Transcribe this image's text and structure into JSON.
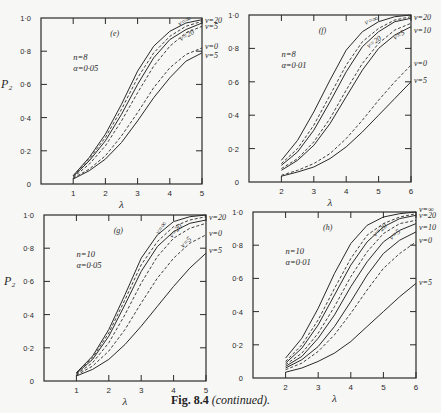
{
  "page": {
    "header_fragment": "344",
    "caption_fig": "Fig. 8.4",
    "caption_rest": "(continued)."
  },
  "chart_data": [
    {
      "type": "line",
      "panel": "(e)",
      "title": "(e)",
      "annotation": [
        "n=8",
        "α=0·05"
      ],
      "xlabel": "λ",
      "ylabel": "P₂",
      "xlim": [
        0,
        5
      ],
      "ylim": [
        0,
        1
      ],
      "xticks": [
        "1",
        "2",
        "3",
        "4",
        "5"
      ],
      "yticks": [
        "0",
        "0·2",
        "0·4",
        "0·6",
        "0·8",
        "1·0"
      ],
      "box": {
        "x0": 41,
        "x1": 202,
        "y0": 18,
        "y1": 184
      },
      "x": [
        1,
        1.5,
        2,
        2.5,
        3,
        3.5,
        4,
        4.5,
        5
      ],
      "series": [
        {
          "name": "ν=∞",
          "style": "solid",
          "values": [
            0.05,
            0.16,
            0.3,
            0.48,
            0.68,
            0.83,
            0.92,
            0.97,
            0.99
          ]
        },
        {
          "name": "ν=20",
          "style": "dashed",
          "values": [
            0.05,
            0.15,
            0.28,
            0.45,
            0.64,
            0.79,
            0.89,
            0.95,
            0.98
          ]
        },
        {
          "name": "ν=20 (solid)",
          "style": "solid",
          "values": [
            0.045,
            0.14,
            0.26,
            0.42,
            0.6,
            0.76,
            0.87,
            0.93,
            0.97
          ]
        },
        {
          "name": "ν=5",
          "style": "dashed",
          "values": [
            0.04,
            0.12,
            0.23,
            0.38,
            0.55,
            0.71,
            0.83,
            0.91,
            0.95
          ]
        },
        {
          "name": "ν=0",
          "style": "dashed",
          "values": [
            0.035,
            0.09,
            0.17,
            0.29,
            0.43,
            0.58,
            0.7,
            0.78,
            0.82
          ]
        },
        {
          "name": "ν=5 (lower)",
          "style": "solid",
          "values": [
            0.03,
            0.08,
            0.15,
            0.25,
            0.38,
            0.52,
            0.64,
            0.74,
            0.79
          ]
        }
      ],
      "right_labels": [
        {
          "text": "ν=20",
          "p": 0.99
        },
        {
          "text": "ν=5",
          "p": 0.95
        },
        {
          "text": "ν=0",
          "p": 0.83
        },
        {
          "text": "ν=5",
          "p": 0.78
        }
      ],
      "inline_labels": [
        {
          "text": "ν=∞",
          "lam": 4.3,
          "p": 0.95,
          "rot": -28
        },
        {
          "text": "ν=20",
          "lam": 4.35,
          "p": 0.86,
          "rot": -30
        }
      ]
    },
    {
      "type": "line",
      "panel": "(f)",
      "title": "(f)",
      "annotation": [
        "n=8",
        "α=0·01"
      ],
      "xlabel": "λ",
      "ylabel": "",
      "xlim": [
        1,
        6
      ],
      "ylim": [
        0,
        1
      ],
      "xticks": [
        "2",
        "3",
        "4",
        "5",
        "6"
      ],
      "yticks": [
        "0",
        "0·2",
        "0·4",
        "0·6",
        "0·8",
        "1·0"
      ],
      "box": {
        "x0": 249,
        "x1": 411,
        "y0": 15,
        "y1": 182
      },
      "x": [
        2,
        2.5,
        3,
        3.5,
        4,
        4.5,
        5,
        5.5,
        6
      ],
      "series": [
        {
          "name": "ν=∞",
          "style": "solid",
          "values": [
            0.13,
            0.25,
            0.42,
            0.61,
            0.79,
            0.9,
            0.96,
            0.99,
            1.0
          ]
        },
        {
          "name": "ν=20",
          "style": "dashed",
          "values": [
            0.11,
            0.2,
            0.34,
            0.52,
            0.7,
            0.84,
            0.92,
            0.97,
            0.99
          ]
        },
        {
          "name": "ν=20 (solid)",
          "style": "solid",
          "values": [
            0.1,
            0.18,
            0.31,
            0.48,
            0.66,
            0.81,
            0.9,
            0.96,
            0.98
          ]
        },
        {
          "name": "ν=5",
          "style": "dashed",
          "values": [
            0.08,
            0.14,
            0.24,
            0.38,
            0.55,
            0.71,
            0.83,
            0.91,
            0.95
          ]
        },
        {
          "name": "ν=10",
          "style": "solid",
          "values": [
            0.07,
            0.13,
            0.22,
            0.35,
            0.51,
            0.67,
            0.8,
            0.88,
            0.93
          ]
        },
        {
          "name": "ν=0",
          "style": "dashed",
          "values": [
            0.04,
            0.07,
            0.11,
            0.17,
            0.26,
            0.37,
            0.49,
            0.6,
            0.7
          ]
        },
        {
          "name": "ν=5 (lower)",
          "style": "solid",
          "values": [
            0.035,
            0.06,
            0.09,
            0.14,
            0.21,
            0.3,
            0.4,
            0.5,
            0.6
          ]
        }
      ],
      "right_labels": [
        {
          "text": "ν=20",
          "p": 0.99
        },
        {
          "text": "ν=10",
          "p": 0.91
        },
        {
          "text": "ν=0",
          "p": 0.71
        },
        {
          "text": "ν=5",
          "p": 0.61
        }
      ],
      "inline_labels": [
        {
          "text": "ν=∞",
          "lam": 4.6,
          "p": 0.94,
          "rot": -22
        },
        {
          "text": "ν=20",
          "lam": 4.7,
          "p": 0.8,
          "rot": -35
        },
        {
          "text": "ν=5",
          "lam": 5.5,
          "p": 0.85,
          "rot": -30
        }
      ]
    },
    {
      "type": "line",
      "panel": "(g)",
      "title": "(g)",
      "annotation": [
        "n=10",
        "α=0·05"
      ],
      "xlabel": "λ",
      "ylabel": "P₂",
      "xlim": [
        0,
        5
      ],
      "ylim": [
        0,
        1
      ],
      "xticks": [
        "1",
        "2",
        "3",
        "4",
        "5"
      ],
      "yticks": [
        "0",
        "0·2",
        "0·4",
        "0·6",
        "0·8",
        "1·0"
      ],
      "box": {
        "x0": 44,
        "x1": 206,
        "y0": 215,
        "y1": 381
      },
      "x": [
        1,
        1.5,
        2,
        2.5,
        3,
        3.5,
        4,
        4.5,
        5
      ],
      "series": [
        {
          "name": "ν=∞",
          "style": "solid",
          "values": [
            0.05,
            0.15,
            0.31,
            0.52,
            0.74,
            0.88,
            0.96,
            0.99,
            1.0
          ]
        },
        {
          "name": "ν=20",
          "style": "dashed",
          "values": [
            0.05,
            0.14,
            0.29,
            0.49,
            0.7,
            0.84,
            0.93,
            0.97,
            0.99
          ]
        },
        {
          "name": "ν=20 (solid)",
          "style": "solid",
          "values": [
            0.045,
            0.13,
            0.27,
            0.46,
            0.66,
            0.81,
            0.9,
            0.95,
            0.97
          ]
        },
        {
          "name": "ν=5",
          "style": "dashed",
          "values": [
            0.04,
            0.11,
            0.23,
            0.4,
            0.59,
            0.75,
            0.86,
            0.92,
            0.95
          ]
        },
        {
          "name": "ν=0",
          "style": "dashed",
          "values": [
            0.035,
            0.09,
            0.18,
            0.31,
            0.47,
            0.62,
            0.74,
            0.83,
            0.88
          ]
        },
        {
          "name": "ν=5 (lower)",
          "style": "solid",
          "values": [
            0.03,
            0.07,
            0.13,
            0.22,
            0.33,
            0.45,
            0.57,
            0.68,
            0.77
          ]
        }
      ],
      "right_labels": [
        {
          "text": "ν=20",
          "p": 0.99
        },
        {
          "text": "ν=0",
          "p": 0.89
        },
        {
          "text": "ν=5",
          "p": 0.79
        }
      ],
      "inline_labels": [
        {
          "text": "ν=∞",
          "lam": 3.55,
          "p": 0.88,
          "rot": -55
        },
        {
          "text": "ν=20",
          "lam": 3.95,
          "p": 0.86,
          "rot": -48
        },
        {
          "text": "ν=5",
          "lam": 4.3,
          "p": 0.8,
          "rot": -45
        }
      ]
    },
    {
      "type": "line",
      "panel": "(h)",
      "title": "(h)",
      "annotation": [
        "n=10",
        "α=0·01"
      ],
      "xlabel": "λ",
      "ylabel": "",
      "xlim": [
        1,
        6
      ],
      "ylim": [
        0,
        1
      ],
      "xticks": [
        "2",
        "3",
        "4",
        "5",
        "6"
      ],
      "yticks": [
        "0",
        "0·2",
        "0·4",
        "0·6",
        "0·8",
        "1·0"
      ],
      "box": {
        "x0": 253,
        "x1": 416,
        "y0": 212,
        "y1": 378
      },
      "x": [
        2,
        2.5,
        3,
        3.5,
        4,
        4.5,
        5,
        5.5,
        6
      ],
      "series": [
        {
          "name": "ν=∞",
          "style": "solid",
          "values": [
            0.12,
            0.24,
            0.42,
            0.63,
            0.81,
            0.92,
            0.97,
            0.99,
            1.0
          ]
        },
        {
          "name": "ν=20",
          "style": "dashed",
          "values": [
            0.1,
            0.2,
            0.35,
            0.54,
            0.72,
            0.86,
            0.93,
            0.97,
            0.99
          ]
        },
        {
          "name": "ν=20 (solid)",
          "style": "solid",
          "values": [
            0.09,
            0.18,
            0.32,
            0.5,
            0.68,
            0.82,
            0.91,
            0.96,
            0.98
          ]
        },
        {
          "name": "ν=5",
          "style": "dashed",
          "values": [
            0.08,
            0.15,
            0.27,
            0.43,
            0.61,
            0.76,
            0.87,
            0.93,
            0.95
          ]
        },
        {
          "name": "ν=10",
          "style": "solid",
          "values": [
            0.07,
            0.13,
            0.24,
            0.38,
            0.55,
            0.7,
            0.82,
            0.89,
            0.93
          ]
        },
        {
          "name": "ν=0",
          "style": "solid",
          "values": [
            0.06,
            0.11,
            0.19,
            0.31,
            0.46,
            0.62,
            0.75,
            0.83,
            0.88
          ]
        },
        {
          "name": "ν=0 (dashed)",
          "style": "dashed",
          "values": [
            0.05,
            0.09,
            0.16,
            0.26,
            0.39,
            0.53,
            0.66,
            0.75,
            0.82
          ]
        },
        {
          "name": "ν=5 (lower)",
          "style": "solid",
          "values": [
            0.035,
            0.06,
            0.1,
            0.15,
            0.22,
            0.31,
            0.4,
            0.49,
            0.57
          ]
        }
      ],
      "right_labels": [
        {
          "text": "ν=∞",
          "p": 1.02
        },
        {
          "text": "ν=20",
          "p": 0.98
        },
        {
          "text": "ν=10",
          "p": 0.91
        },
        {
          "text": "ν=0",
          "p": 0.83
        },
        {
          "text": "ν=5",
          "p": 0.58
        }
      ],
      "inline_labels": [
        {
          "text": "ν=20",
          "lam": 4.75,
          "p": 0.85,
          "rot": -40
        },
        {
          "text": "ν=5",
          "lam": 5.25,
          "p": 0.83,
          "rot": -40
        }
      ]
    }
  ]
}
